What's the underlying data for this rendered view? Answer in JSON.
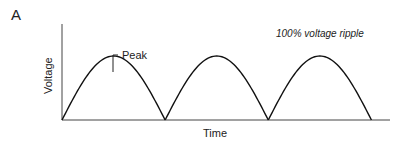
{
  "panel_label": "A",
  "chart_data": {
    "type": "line",
    "title": "",
    "annotation": "100% voltage ripple",
    "xlabel": "Time",
    "ylabel": "Voltage",
    "peak_label": "Peak",
    "series": [
      {
        "name": "full-wave rectified voltage",
        "shape": "rectified-sine",
        "cycles": 3,
        "amplitude": 1,
        "ripple_percent": 100
      }
    ],
    "ylim": [
      0,
      1.5
    ],
    "xlim": [
      0,
      3.18
    ],
    "grid": false,
    "legend": "none"
  }
}
